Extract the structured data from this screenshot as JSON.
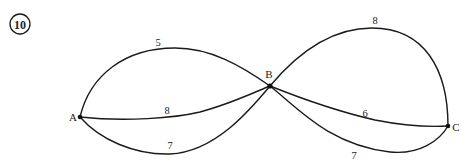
{
  "problem": {
    "number": "10"
  },
  "graph": {
    "nodes": [
      {
        "id": "A",
        "label": "A",
        "x": 80,
        "y": 117
      },
      {
        "id": "B",
        "label": "B",
        "x": 270,
        "y": 86
      },
      {
        "id": "C",
        "label": "C",
        "x": 448,
        "y": 126
      }
    ],
    "edges": [
      {
        "from": "A",
        "to": "B",
        "weight": "5",
        "position": "upper-arc"
      },
      {
        "from": "A",
        "to": "B",
        "weight": "8",
        "position": "middle"
      },
      {
        "from": "A",
        "to": "B",
        "weight": "7",
        "position": "lower-arc"
      },
      {
        "from": "B",
        "to": "C",
        "weight": "8",
        "position": "upper-arc"
      },
      {
        "from": "B",
        "to": "C",
        "weight": "6",
        "position": "middle"
      },
      {
        "from": "B",
        "to": "C",
        "weight": "7",
        "position": "lower-arc"
      }
    ]
  },
  "colors": {
    "stroke": "#1a1a1a",
    "background": "#ffffff"
  }
}
